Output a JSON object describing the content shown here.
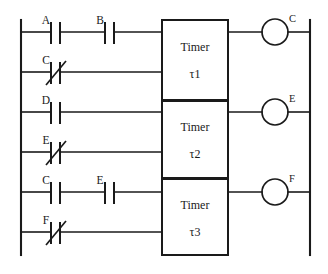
{
  "diagram": {
    "type": "ladder-logic",
    "line_color": "#1a1a1a",
    "background_color": "#ffffff",
    "rails": {
      "left_label": "",
      "right_label": ""
    },
    "rungs": [
      {
        "id": "rung-1",
        "y": 32,
        "contacts": [
          {
            "label": "A",
            "type": "normally-open",
            "x": 55
          },
          {
            "label": "B",
            "type": "normally-open",
            "x": 109
          }
        ],
        "output": {
          "label": "C",
          "type": "coil",
          "x": 275
        },
        "block_ref": "timer-1"
      },
      {
        "id": "rung-2",
        "y": 72,
        "contacts": [
          {
            "label": "C",
            "type": "normally-closed",
            "x": 55
          }
        ],
        "output": null,
        "block_ref": "timer-1"
      },
      {
        "id": "rung-3",
        "y": 112,
        "contacts": [
          {
            "label": "D",
            "type": "normally-open",
            "x": 55
          }
        ],
        "output": {
          "label": "E",
          "type": "coil",
          "x": 275
        },
        "block_ref": "timer-2"
      },
      {
        "id": "rung-4",
        "y": 152,
        "contacts": [
          {
            "label": "E",
            "type": "normally-closed",
            "x": 55
          }
        ],
        "output": null,
        "block_ref": "timer-2"
      },
      {
        "id": "rung-5",
        "y": 192,
        "contacts": [
          {
            "label": "C",
            "type": "normally-open",
            "x": 55
          },
          {
            "label": "E",
            "type": "normally-open",
            "x": 109
          }
        ],
        "output": {
          "label": "F",
          "type": "coil",
          "x": 275
        },
        "block_ref": "timer-3"
      },
      {
        "id": "rung-6",
        "y": 232,
        "contacts": [
          {
            "label": "F",
            "type": "normally-closed",
            "x": 55
          }
        ],
        "output": null,
        "block_ref": "timer-3"
      }
    ],
    "blocks": [
      {
        "id": "timer-1",
        "title": "Timer",
        "parameter": "τ1",
        "x": 162,
        "y": 20,
        "width": 66,
        "height": 80
      },
      {
        "id": "timer-2",
        "title": "Timer",
        "parameter": "τ2",
        "x": 162,
        "y": 101,
        "width": 66,
        "height": 77
      },
      {
        "id": "timer-3",
        "title": "Timer",
        "parameter": "τ3",
        "x": 162,
        "y": 179,
        "width": 66,
        "height": 76
      }
    ]
  }
}
